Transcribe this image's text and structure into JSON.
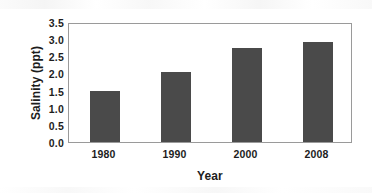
{
  "chart_data": {
    "type": "bar",
    "title": "",
    "xlabel": "Year",
    "ylabel": "Salinity (ppt)",
    "categories": [
      "1980",
      "1990",
      "2000",
      "2008"
    ],
    "values": [
      1.48,
      2.04,
      2.73,
      2.92
    ],
    "series": [
      {
        "name": "Salinity",
        "values": [
          1.48,
          2.04,
          2.73,
          2.92
        ]
      }
    ],
    "ylim": [
      0.0,
      3.5
    ],
    "y_ticks": [
      "0.0",
      "0.5",
      "1.0",
      "1.5",
      "2.0",
      "2.5",
      "3.0",
      "3.5"
    ],
    "y_tick_values": [
      0.0,
      0.5,
      1.0,
      1.5,
      2.0,
      2.5,
      3.0,
      3.5
    ],
    "grid": false,
    "legend": false,
    "legend_position": "none",
    "bar_color": "#4a4a4a",
    "axis_color": "#9a9a9a",
    "text_color": "#1d1d1d",
    "background_color": "#ffffff"
  }
}
